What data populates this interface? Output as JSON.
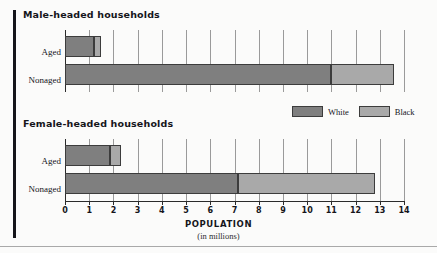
{
  "figure": {
    "axis_title": "POPULATION",
    "axis_subtitle": "(in millions)"
  },
  "panels": [
    {
      "title": "Male-headed households"
    },
    {
      "title": "Female-headed households"
    }
  ],
  "legend": {
    "items": [
      {
        "label": "White",
        "color": "#7f7f7f"
      },
      {
        "label": "Black",
        "color": "#a9a9a9"
      }
    ]
  },
  "axis": {
    "ticks": [
      "0",
      "1",
      "2",
      "3",
      "4",
      "5",
      "6",
      "7",
      "8",
      "9",
      "10",
      "11",
      "12",
      "13",
      "14"
    ]
  },
  "categories": [
    "Aged",
    "Nonaged"
  ],
  "chart_data": {
    "type": "bar",
    "orientation": "horizontal",
    "stacked": true,
    "title": "",
    "xlabel": "POPULATION (in millions)",
    "ylabel": "",
    "xlim": [
      0,
      14
    ],
    "xticks": [
      0,
      1,
      2,
      3,
      4,
      5,
      6,
      7,
      8,
      9,
      10,
      11,
      12,
      13,
      14
    ],
    "grid": true,
    "legend_position": "middle-right",
    "panels": [
      {
        "name": "Male-headed households",
        "categories": [
          "Aged",
          "Nonaged"
        ],
        "series": [
          {
            "name": "White",
            "color": "#7f7f7f",
            "values": [
              1.2,
              11.0
            ]
          },
          {
            "name": "Black",
            "color": "#a9a9a9",
            "values": [
              0.3,
              2.6
            ]
          }
        ],
        "totals": [
          1.5,
          13.6
        ]
      },
      {
        "name": "Female-headed households",
        "categories": [
          "Aged",
          "Nonaged"
        ],
        "series": [
          {
            "name": "White",
            "color": "#7f7f7f",
            "values": [
              1.85,
              7.15
            ]
          },
          {
            "name": "Black",
            "color": "#a9a9a9",
            "values": [
              0.45,
              5.65
            ]
          }
        ],
        "totals": [
          2.3,
          12.8
        ]
      }
    ]
  }
}
